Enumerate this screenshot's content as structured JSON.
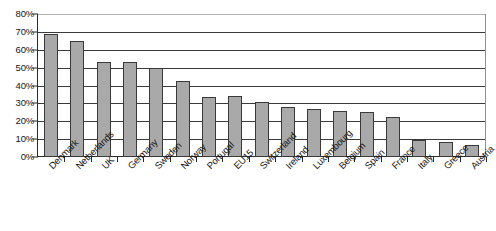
{
  "chart_data": {
    "type": "bar",
    "title": "",
    "subtitle": "",
    "xlabel": "",
    "ylabel": "",
    "ylim": [
      0,
      80
    ],
    "ytick_labels": [
      "80%",
      "70%",
      "60%",
      "50%",
      "40%",
      "30%",
      "20%",
      "10%",
      "0%"
    ],
    "ytick_values": [
      80,
      70,
      60,
      50,
      40,
      30,
      20,
      10,
      0
    ],
    "grid": true,
    "legend": false,
    "legend_position": "none",
    "units": "percent",
    "categories": [
      "Denmark",
      "Netherlands",
      "UK",
      "Germany",
      "Sweden",
      "Norway",
      "Portugal",
      "EU15",
      "Switzerland",
      "Ireland",
      "Luxembourg",
      "Belgium",
      "Spain",
      "France",
      "Italy",
      "Greece",
      "Austria"
    ],
    "values": [
      69,
      65,
      53,
      53,
      50,
      42.5,
      33.5,
      34,
      31,
      28,
      27,
      26,
      25,
      22.5,
      9.5,
      8.5,
      6.5
    ],
    "bar_color": "#a9a9a9",
    "bar_edge_color": "#3a3a3a",
    "gridline_color": "#3a3a3a",
    "axis_color": "#2b2b2b",
    "background_color": "#ffffff"
  }
}
